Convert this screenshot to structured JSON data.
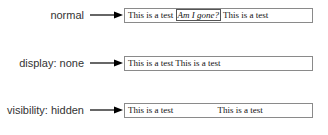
{
  "rows": [
    {
      "label": "normal",
      "text_before": "This is a test",
      "middle": "Am I gone?",
      "text_after": "This is a test"
    },
    {
      "label": "display: none",
      "text": "This is a test This is a test"
    },
    {
      "label": "visibility: hidden",
      "text_before": "This is a test",
      "text_after": "This is a test"
    }
  ],
  "colors": {
    "label": "#333333",
    "arrow": "#000000",
    "box_border": "#8a8a8a"
  }
}
